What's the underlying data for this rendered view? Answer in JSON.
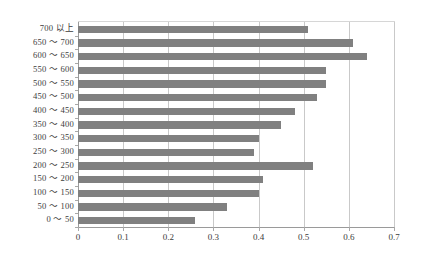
{
  "chart_data": {
    "type": "bar",
    "orientation": "horizontal",
    "title": "",
    "xlabel": "",
    "ylabel": "",
    "xlim": [
      0,
      0.7
    ],
    "xticks": [
      "0",
      "0.1",
      "0.2",
      "0.3",
      "0.4",
      "0.5",
      "0.6",
      "0.7"
    ],
    "xtick_values": [
      0,
      0.1,
      0.2,
      0.3,
      0.4,
      0.5,
      0.6,
      0.7
    ],
    "grid": true,
    "legend": false,
    "bar_color": "#808080",
    "categories": [
      "700 以上",
      "650 ～ 700",
      "600 ～ 650",
      "550 ～ 600",
      "500 ～ 550",
      "450 ～ 500",
      "400 ～ 450",
      "350 ～ 400",
      "300 ～ 350",
      "250 ～ 300",
      "200 ～ 250",
      "150 ～ 200",
      "100 ～ 150",
      "50 ～ 100",
      "0 ～ 50"
    ],
    "values": [
      0.51,
      0.61,
      0.64,
      0.55,
      0.55,
      0.53,
      0.48,
      0.45,
      0.4,
      0.39,
      0.52,
      0.41,
      0.4,
      0.33,
      0.26
    ]
  }
}
